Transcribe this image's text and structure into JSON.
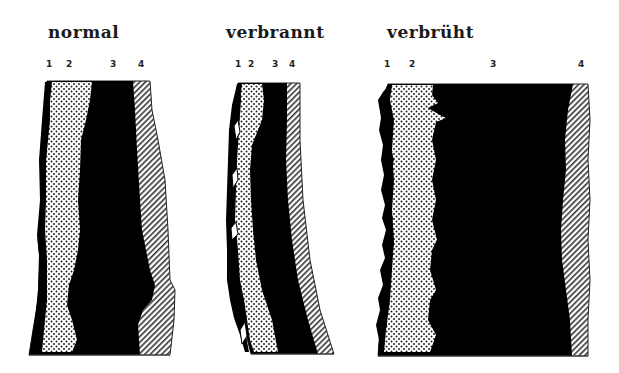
{
  "figure": {
    "legend_note": "Layer numbers 1-4 shown above each section",
    "layer_patterns": {
      "1": {
        "fill": "#000000",
        "pattern": "solid-thin-edge"
      },
      "2": {
        "fill": "dotted",
        "pattern": "dots"
      },
      "3": {
        "fill": "#000000",
        "pattern": "solid"
      },
      "4": {
        "fill": "hatched",
        "pattern": "diagonal-lines"
      }
    }
  },
  "panels": [
    {
      "title": "normal",
      "labels": [
        "1",
        "2",
        "3",
        "4"
      ]
    },
    {
      "title": "verbrannt",
      "labels": [
        "1",
        "2",
        "3",
        "4"
      ]
    },
    {
      "title": "verbrüht",
      "labels": [
        "1",
        "2",
        "3",
        "4"
      ]
    }
  ]
}
